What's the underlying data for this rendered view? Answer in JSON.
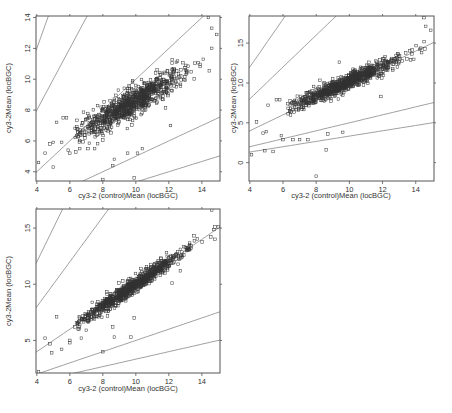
{
  "figure": {
    "width": 452,
    "height": 413,
    "point_color": "#333333",
    "line_color": "#888888",
    "frame_color": "#555555"
  },
  "chart_data": [
    {
      "type": "scatter",
      "title": "",
      "xlabel": "cy3-2 (control)Mean (locBGC)",
      "ylabel": "cy3-2Mean (locBGC)",
      "xlim": [
        3.95,
        15.1
      ],
      "ylim": [
        3.4,
        14.1
      ],
      "xticks": [
        4,
        6,
        8,
        10,
        12,
        14
      ],
      "yticks": [
        4,
        6,
        8,
        10,
        12,
        14
      ],
      "frame": {
        "left": 36,
        "top": 16,
        "right": 220,
        "bottom": 181
      },
      "reference_lines": [
        {
          "name": "3x",
          "slope": 3.0
        },
        {
          "name": "2x",
          "slope": 2.0
        },
        {
          "name": "1x",
          "slope": 1.0
        },
        {
          "name": "0.5x",
          "slope": 0.5
        },
        {
          "name": "0.33x",
          "slope": 0.3333
        }
      ],
      "trend": {
        "slope": 0.62,
        "intercept": 2.4,
        "spread": 0.75
      },
      "outliers": [
        [
          4.1,
          4.6
        ],
        [
          4.5,
          5.2
        ],
        [
          4.8,
          5.8
        ],
        [
          5.0,
          5.9
        ],
        [
          5.2,
          7.2
        ],
        [
          5.0,
          4.3
        ],
        [
          5.6,
          7.5
        ],
        [
          5.8,
          7.5
        ],
        [
          5.5,
          5.9
        ],
        [
          5.9,
          5.4
        ],
        [
          6.0,
          5.2
        ],
        [
          6.6,
          5.5
        ],
        [
          7.1,
          5.5
        ],
        [
          7.5,
          5.5
        ],
        [
          8.0,
          3.5
        ],
        [
          8.7,
          4.8
        ],
        [
          8.6,
          4.4
        ],
        [
          9.5,
          5.2
        ],
        [
          9.9,
          3.6
        ],
        [
          10.1,
          5.2
        ],
        [
          10.4,
          5.5
        ],
        [
          9.5,
          9.4
        ],
        [
          9.8,
          9.8
        ],
        [
          12.1,
          7.0
        ],
        [
          14.4,
          14.0
        ],
        [
          14.6,
          13.3
        ],
        [
          14.9,
          12.9
        ]
      ],
      "n_points": 900
    },
    {
      "type": "scatter",
      "title": "",
      "xlabel": "cy3-2 (control)Mean (locBGC)",
      "ylabel": "cy3-2Mean (locBGC)",
      "xlim": [
        3.95,
        15.1
      ],
      "ylim": [
        -2.3,
        18.4
      ],
      "xticks": [
        4,
        6,
        8,
        10,
        12,
        14
      ],
      "yticks": [
        0,
        5,
        10,
        15
      ],
      "frame": {
        "left": 249,
        "top": 16,
        "right": 434,
        "bottom": 181
      },
      "reference_lines": [
        {
          "name": "3x",
          "slope": 3.0
        },
        {
          "name": "2x",
          "slope": 2.0
        },
        {
          "name": "1x",
          "slope": 1.0
        },
        {
          "name": "0.5x",
          "slope": 0.5
        },
        {
          "name": "0.33x",
          "slope": 0.3333
        }
      ],
      "trend": {
        "slope": 0.93,
        "intercept": 0.9,
        "spread": 0.8
      },
      "outliers": [
        [
          4.1,
          1.0
        ],
        [
          4.4,
          5.1
        ],
        [
          4.8,
          3.7
        ],
        [
          5.0,
          3.9
        ],
        [
          4.9,
          1.5
        ],
        [
          5.4,
          1.4
        ],
        [
          5.1,
          7.2
        ],
        [
          5.6,
          7.9
        ],
        [
          5.8,
          7.9
        ],
        [
          5.9,
          3.4
        ],
        [
          6.0,
          2.9
        ],
        [
          6.6,
          2.9
        ],
        [
          7.0,
          2.9
        ],
        [
          7.5,
          2.9
        ],
        [
          8.6,
          1.6
        ],
        [
          8.0,
          -1.7
        ],
        [
          8.7,
          3.6
        ],
        [
          9.6,
          3.8
        ],
        [
          9.4,
          12.6
        ],
        [
          14.5,
          18.2
        ],
        [
          14.6,
          17.1
        ],
        [
          14.9,
          16.6
        ],
        [
          11.9,
          8.3
        ]
      ],
      "n_points": 900
    },
    {
      "type": "scatter",
      "title": "",
      "xlabel": "cy3-2 (control)Mean (locBGC)",
      "ylabel": "cy3-2Mean (locBGC)",
      "xlim": [
        3.95,
        15.1
      ],
      "ylim": [
        2.1,
        16.7
      ],
      "xticks": [
        4,
        6,
        8,
        10,
        12,
        14
      ],
      "yticks": [
        5,
        10,
        15
      ],
      "frame": {
        "left": 36,
        "top": 209,
        "right": 220,
        "bottom": 373
      },
      "reference_lines": [
        {
          "name": "3x",
          "slope": 3.0
        },
        {
          "name": "2x",
          "slope": 2.0
        },
        {
          "name": "1x",
          "slope": 1.0
        },
        {
          "name": "0.5x",
          "slope": 0.5
        },
        {
          "name": "0.33x",
          "slope": 0.3333
        }
      ],
      "trend": {
        "slope": 1.0,
        "intercept": 0.0,
        "spread": 0.55
      },
      "outliers": [
        [
          4.1,
          2.2
        ],
        [
          4.5,
          5.2
        ],
        [
          4.8,
          4.7
        ],
        [
          4.9,
          3.9
        ],
        [
          5.5,
          4.2
        ],
        [
          5.2,
          7.1
        ],
        [
          6.0,
          5.0
        ],
        [
          6.0,
          4.8
        ],
        [
          6.7,
          5.2
        ],
        [
          7.0,
          5.9
        ],
        [
          8.0,
          4.0
        ],
        [
          8.7,
          5.3
        ],
        [
          8.6,
          6.2
        ],
        [
          9.7,
          5.3
        ],
        [
          9.9,
          7.0
        ],
        [
          9.5,
          10.3
        ],
        [
          14.6,
          16.6
        ],
        [
          14.8,
          15.1
        ],
        [
          15.0,
          15.1
        ],
        [
          14.8,
          14.0
        ],
        [
          12.2,
          10.1
        ],
        [
          12.7,
          11.2
        ]
      ],
      "n_points": 900
    }
  ]
}
